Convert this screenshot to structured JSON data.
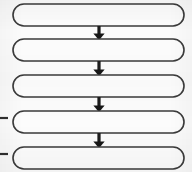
{
  "diagram": {
    "title": "",
    "type": "vertical-flowchart",
    "orientation": "top-to-bottom",
    "background_color": "#fbfbfb",
    "canvas": {
      "width": 192,
      "height": 172
    },
    "node_style": {
      "shape": "stadium",
      "fill_color": "#fcfcfc",
      "stroke_color": "#3a3a3a",
      "stroke_width": 1.6,
      "corner_radius": 11
    },
    "connector_style": {
      "kind": "solid-arrow",
      "color": "#141414",
      "line_width": 3.2,
      "head": "filled-triangle",
      "direction": "down"
    },
    "nodes": [
      {
        "id": "node-1",
        "label": "",
        "x": 13,
        "y": 4,
        "width": 171,
        "height": 22
      },
      {
        "id": "node-2",
        "label": "",
        "x": 13,
        "y": 39,
        "width": 171,
        "height": 22
      },
      {
        "id": "node-3",
        "label": "",
        "x": 13,
        "y": 75,
        "width": 171,
        "height": 22
      },
      {
        "id": "node-4",
        "label": "",
        "x": 13,
        "y": 111,
        "width": 171,
        "height": 22
      },
      {
        "id": "node-5",
        "label": "",
        "x": 13,
        "y": 147,
        "width": 171,
        "height": 22
      }
    ],
    "connectors": [
      {
        "id": "arrow-1",
        "from": "node-1",
        "to": "node-2",
        "x": 99,
        "y_start": 26,
        "y_end": 39
      },
      {
        "id": "arrow-2",
        "from": "node-2",
        "to": "node-3",
        "x": 99,
        "y_start": 61,
        "y_end": 75
      },
      {
        "id": "arrow-3",
        "from": "node-3",
        "to": "node-4",
        "x": 99,
        "y_start": 97,
        "y_end": 111
      },
      {
        "id": "arrow-4",
        "from": "node-4",
        "to": "node-5",
        "x": 99,
        "y_start": 133,
        "y_end": 147
      }
    ],
    "margin_marks": [
      {
        "id": "tick-1",
        "label": "",
        "x_start": 0,
        "x_end": 8,
        "y": 118
      },
      {
        "id": "tick-2",
        "label": "",
        "x_start": 0,
        "x_end": 8,
        "y": 154
      }
    ]
  }
}
